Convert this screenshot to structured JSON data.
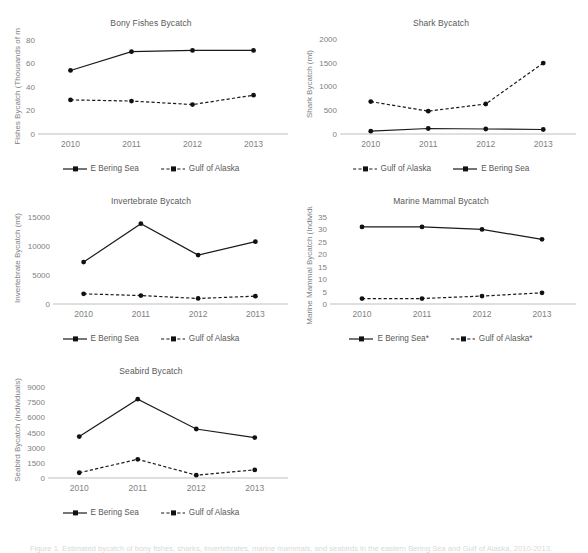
{
  "figure": {
    "background": "#ffffff",
    "text_color": "#595959",
    "tick_color": "#7f7f7f",
    "axis_color": "#bfbfbf",
    "series_color": "#111111",
    "width": 588,
    "height": 550,
    "caption": "Figure 1. Estimated bycatch of bony fishes, sharks, invertebrates, marine mammals, and seabirds in the eastern Bering Sea and Gulf of Alaska, 2010-2013."
  },
  "legend_markers": {
    "solid": "solid-line-marker",
    "dashed": "dashed-line-marker"
  },
  "chart_data": [
    {
      "id": "bony-fishes",
      "type": "line",
      "title": "Bony Fishes Bycatch",
      "xlabel": "",
      "ylabel": "Fishes Bycatch (Thousands of mt)",
      "categories": [
        "2010",
        "2011",
        "2012",
        "2013"
      ],
      "yticks": [
        0,
        20,
        40,
        60,
        80
      ],
      "ylim": [
        0,
        85
      ],
      "grid": false,
      "legend_position": "bottom",
      "series": [
        {
          "name": "E Bering Sea",
          "style": "solid",
          "values": [
            54,
            70,
            71,
            71
          ]
        },
        {
          "name": "Gulf of Alaska",
          "style": "dashed",
          "values": [
            29,
            28,
            25,
            33
          ]
        }
      ]
    },
    {
      "id": "shark",
      "type": "line",
      "title": "Shark Bycatch",
      "xlabel": "",
      "ylabel": "Shark Bycatch (mt)",
      "categories": [
        "2010",
        "2011",
        "2012",
        "2013"
      ],
      "yticks": [
        0,
        500,
        1000,
        1500,
        2000
      ],
      "ylim": [
        0,
        2100
      ],
      "grid": false,
      "legend_position": "bottom",
      "series": [
        {
          "name": "Gulf of Alaska",
          "style": "dashed",
          "values": [
            680,
            480,
            630,
            1490
          ]
        },
        {
          "name": "E Bering Sea",
          "style": "solid",
          "values": [
            60,
            115,
            105,
            95
          ]
        }
      ]
    },
    {
      "id": "invertebrate",
      "type": "line",
      "title": "Invertebrate Bycatch",
      "xlabel": "",
      "ylabel": "Invertebrate Bycatch (mt)",
      "categories": [
        "2010",
        "2011",
        "2012",
        "2013"
      ],
      "yticks": [
        0,
        5000,
        10000,
        15000
      ],
      "ylim": [
        0,
        15800
      ],
      "grid": false,
      "legend_position": "bottom",
      "series": [
        {
          "name": "E Bering Sea",
          "style": "solid",
          "values": [
            7200,
            13800,
            8400,
            10700
          ]
        },
        {
          "name": "Gulf of Alaska",
          "style": "dashed",
          "values": [
            1750,
            1450,
            950,
            1350
          ]
        }
      ]
    },
    {
      "id": "marine-mammal",
      "type": "line",
      "title": "Marine Mammal Bycatch",
      "xlabel": "",
      "ylabel": "Marine Mammal Bycatch (Individuals)",
      "categories": [
        "2010",
        "2011",
        "2012",
        "2013"
      ],
      "yticks": [
        0,
        5,
        10,
        15,
        20,
        25,
        30,
        35
      ],
      "ylim": [
        0,
        37
      ],
      "grid": false,
      "legend_position": "bottom",
      "series": [
        {
          "name": "E Bering Sea*",
          "style": "solid",
          "values": [
            31,
            31,
            30,
            26
          ]
        },
        {
          "name": "Gulf of Alaska*",
          "style": "dashed",
          "values": [
            2.2,
            2.2,
            3.2,
            4.5
          ]
        }
      ]
    },
    {
      "id": "seabird",
      "type": "line",
      "title": "Seabird Bycatch",
      "xlabel": "",
      "ylabel": "Seabird Bycatch (Individuals)",
      "categories": [
        "2010",
        "2011",
        "2012",
        "2013"
      ],
      "yticks": [
        0,
        1500,
        3000,
        4500,
        6000,
        7500,
        9000
      ],
      "ylim": [
        0,
        9500
      ],
      "grid": false,
      "legend_position": "bottom",
      "series": [
        {
          "name": "E Bering Sea",
          "style": "solid",
          "values": [
            4100,
            7800,
            4850,
            4000
          ]
        },
        {
          "name": "Gulf of Alaska",
          "style": "dashed",
          "values": [
            520,
            1850,
            280,
            800
          ]
        }
      ]
    }
  ]
}
